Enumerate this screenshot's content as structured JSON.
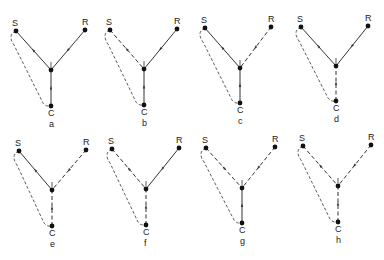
{
  "figure": {
    "node_labels": {
      "S": "S",
      "R": "R",
      "I": "I",
      "C": "C"
    },
    "line_color": "#333333",
    "panels": [
      {
        "id": "a",
        "caption": "a",
        "SI": "solid",
        "RI": "solid",
        "CI": "solid"
      },
      {
        "id": "b",
        "caption": "b",
        "SI": "dashed",
        "RI": "solid",
        "CI": "solid"
      },
      {
        "id": "c",
        "caption": "c",
        "SI": "solid",
        "RI": "dashed",
        "CI": "solid"
      },
      {
        "id": "d",
        "caption": "d",
        "SI": "solid",
        "RI": "solid",
        "CI": "dashed"
      },
      {
        "id": "e",
        "caption": "e",
        "SI": "solid",
        "RI": "dashed",
        "CI": "dashed"
      },
      {
        "id": "f",
        "caption": "f",
        "SI": "dashed",
        "RI": "solid",
        "CI": "dashed"
      },
      {
        "id": "g",
        "caption": "g",
        "SI": "dashed",
        "RI": "dashed",
        "CI": "solid"
      },
      {
        "id": "h",
        "caption": "h",
        "SI": "dashed",
        "RI": "dashed",
        "CI": "dashed"
      }
    ],
    "loop_style": "dashed"
  }
}
